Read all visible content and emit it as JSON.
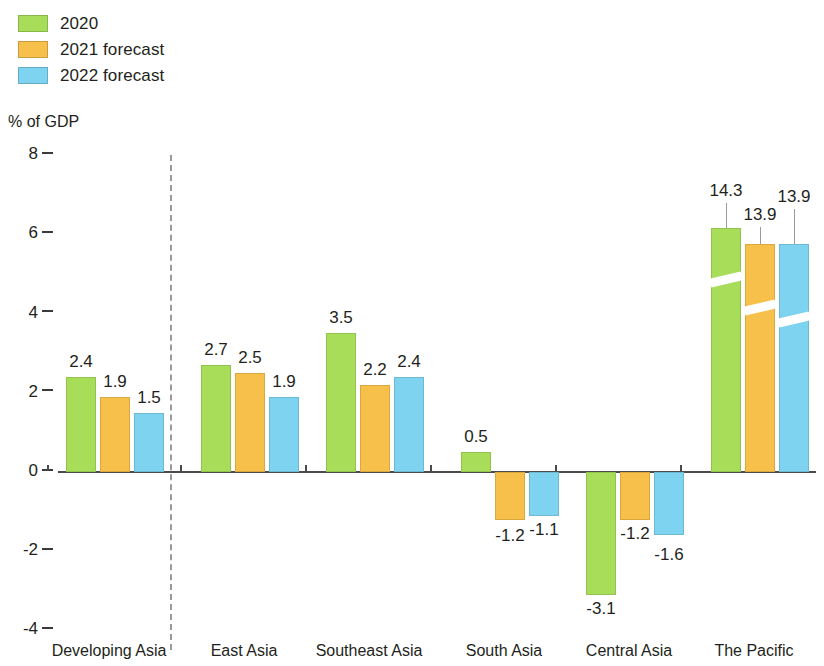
{
  "legend": {
    "items": [
      {
        "label": "2020",
        "color": "#a8dd5a"
      },
      {
        "label": "2021 forecast",
        "color": "#f7c04a"
      },
      {
        "label": "2022 forecast",
        "color": "#7dd3f0"
      }
    ]
  },
  "axis": {
    "y_title": "% of GDP",
    "yticks": [
      "8",
      "6",
      "4",
      "2",
      "0",
      "-2",
      "-4"
    ]
  },
  "chart_data": {
    "type": "bar",
    "title": "",
    "subtitle": "",
    "xlabel": "",
    "ylabel": "% of GDP",
    "ylim": [
      -4,
      8
    ],
    "yticks": [
      8,
      6,
      4,
      2,
      0,
      -2,
      -4
    ],
    "grid": false,
    "legend_position": "top-left",
    "categories": [
      "Developing Asia",
      "East Asia",
      "Southeast Asia",
      "South Asia",
      "Central Asia",
      "The Pacific"
    ],
    "series": [
      {
        "name": "2020",
        "color": "#a8dd5a",
        "values": [
          2.4,
          2.7,
          3.5,
          0.5,
          -3.1,
          14.3
        ]
      },
      {
        "name": "2021 forecast",
        "color": "#f7c04a",
        "values": [
          1.9,
          2.5,
          2.2,
          -1.2,
          -1.2,
          13.9
        ]
      },
      {
        "name": "2022 forecast",
        "color": "#7dd3f0",
        "values": [
          1.5,
          1.9,
          2.4,
          -1.1,
          -1.6,
          13.9
        ]
      }
    ],
    "data_labels": [
      [
        "2.4",
        "1.9",
        "1.5"
      ],
      [
        "2.7",
        "2.5",
        "1.9"
      ],
      [
        "3.5",
        "2.2",
        "2.4"
      ],
      [
        "0.5",
        "-1.2",
        "-1.1"
      ],
      [
        "-3.1",
        "-1.2",
        "-1.6"
      ],
      [
        "14.3",
        "13.9",
        "13.9"
      ]
    ],
    "annotations": [
      {
        "type": "axis-break",
        "applies_to": "The Pacific",
        "note": "bars truncated with diagonal break marks"
      },
      {
        "type": "separator",
        "note": "dashed vertical line after Developing Asia aggregate"
      }
    ]
  }
}
